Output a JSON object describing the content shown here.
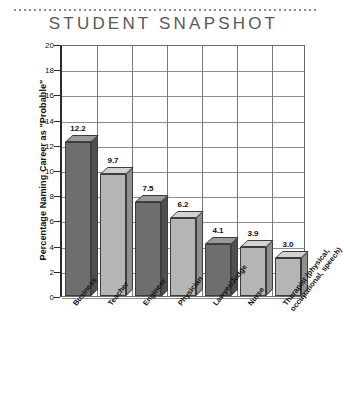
{
  "chart_data": {
    "type": "bar",
    "title": "STUDENT SNAPSHOT",
    "xlabel": "",
    "ylabel": "Percentage Naming Career as \"Probable\"",
    "ylim": [
      0,
      20
    ],
    "ytick_step": 2,
    "yticks": [
      "20",
      "18",
      "16",
      "14",
      "12",
      "10",
      "8",
      "6",
      "4",
      "2",
      "0"
    ],
    "grid": true,
    "legend": "none",
    "categories": [
      "Business",
      "Teacher",
      "Engineer",
      "Physician",
      "Lawyer/Judge",
      "Nurse",
      "Therapist (physical, occupational, speech)"
    ],
    "category_lines": [
      [
        "Business"
      ],
      [
        "Teacher"
      ],
      [
        "Engineer"
      ],
      [
        "Physician"
      ],
      [
        "Lawyer/Judge"
      ],
      [
        "Nurse"
      ],
      [
        "Therapist (physical,",
        "occupational, speech)"
      ]
    ],
    "values": [
      12.2,
      9.7,
      7.5,
      6.2,
      4.1,
      3.9,
      3.0
    ],
    "value_labels": [
      "12.2",
      "9.7",
      "7.5",
      "6.2",
      "4.1",
      "3.9",
      "3.0"
    ],
    "bar_colors": [
      "#6e6e6e",
      "#b5b5b5",
      "#6e6e6e",
      "#b5b5b5",
      "#6e6e6e",
      "#b5b5b5",
      "#b5b5b5"
    ],
    "bar_top_colors": [
      "#9a9a9a",
      "#d2d2d2",
      "#9a9a9a",
      "#d2d2d2",
      "#9a9a9a",
      "#d2d2d2",
      "#d2d2d2"
    ],
    "bar_side_colors": [
      "#4f4f4f",
      "#8f8f8f",
      "#4f4f4f",
      "#8f8f8f",
      "#4f4f4f",
      "#8f8f8f",
      "#8f8f8f"
    ]
  },
  "style": {
    "title_color": "#58585a",
    "axis_color": "#2b2b2b",
    "grid_color": "#8d8d8d",
    "background": "#ffffff"
  }
}
